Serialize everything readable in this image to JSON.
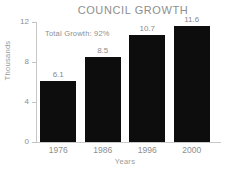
{
  "chart_data": {
    "type": "bar",
    "title": "COUNCIL GROWTH",
    "xlabel": "Years",
    "ylabel": "Thousands",
    "categories": [
      "1976",
      "1986",
      "1996",
      "2000"
    ],
    "values": [
      6.1,
      8.5,
      10.7,
      11.6
    ],
    "value_labels": [
      "6.1",
      "8.5",
      "10.7",
      "11.6"
    ],
    "ylim": [
      0,
      12
    ],
    "yticks": [
      0,
      4,
      8,
      12
    ],
    "ytick_labels": [
      "0",
      "4",
      "8",
      "12"
    ],
    "grid": false,
    "legend": false,
    "annotations": [
      {
        "name": "total-growth",
        "text": "Total Growth: 92%"
      }
    ],
    "colors": {
      "bar": "#0d0d0d",
      "background": "#ffffff",
      "text": "#8e8e8e",
      "axis": "#c6c6c6"
    }
  }
}
